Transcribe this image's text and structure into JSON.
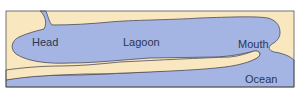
{
  "diagram": {
    "type": "lagoon-schematic",
    "labels": {
      "head": "Head",
      "lagoon": "Lagoon",
      "mouth": "Mouth",
      "ocean": "Ocean"
    },
    "colors": {
      "land": "#f9e7c0",
      "water": "#a5b5e3",
      "outline": "#4a4a5a",
      "frame": "#555555",
      "text": "#2a3550"
    }
  }
}
